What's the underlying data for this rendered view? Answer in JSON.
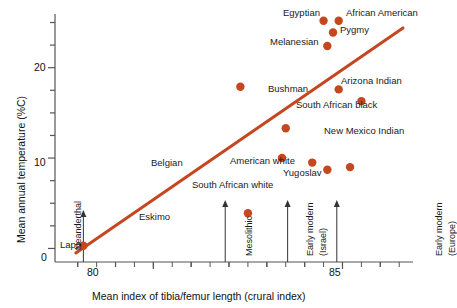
{
  "chart_data": {
    "type": "scatter",
    "title": "",
    "xlabel": "Mean index of tibia/femur length (crural index)",
    "ylabel": "Mean annual temperature (%C)",
    "xlim": [
      77.4,
      86.6
    ],
    "ylim": [
      -1.5,
      25.5
    ],
    "xticks": [
      78,
      79,
      80,
      81,
      82,
      83,
      84,
      85,
      86
    ],
    "xtick_labels": [
      "",
      "",
      "80",
      "",
      "",
      "",
      "",
      "85",
      ""
    ],
    "yticks": [
      0,
      2.5,
      5,
      7.5,
      10,
      12.5,
      15,
      17.5,
      20,
      22.5,
      25
    ],
    "ytick_labels": [
      "0",
      "",
      "",
      "",
      "10",
      "",
      "",
      "",
      "20",
      "",
      ""
    ],
    "grid": false,
    "legend": "none",
    "marker_color": "#c4471f",
    "line_color": "#c4471f",
    "axis_color": "#555555",
    "points": [
      {
        "label": "Lapp",
        "x": 78.15,
        "y": 0.3,
        "label_pos": "above-left"
      },
      {
        "label": "Eskimo",
        "x": 82.5,
        "y": 3.9,
        "label_pos": "left"
      },
      {
        "label": "Belgian",
        "x": 83.4,
        "y": 10.0,
        "label_pos": "left"
      },
      {
        "label": "American white",
        "x": 84.2,
        "y": 9.5,
        "label_pos": "right-above"
      },
      {
        "label": "South African white",
        "x": 84.6,
        "y": 8.7,
        "label_pos": "below-left"
      },
      {
        "label": "Yugoslav",
        "x": 85.2,
        "y": 9.0,
        "label_pos": "right"
      },
      {
        "label": "Bushman",
        "x": 82.3,
        "y": 17.9,
        "label_pos": "right"
      },
      {
        "label": "New Mexico Indian",
        "x": 83.5,
        "y": 13.3,
        "label_pos": "right"
      },
      {
        "label": "Arizona Indian",
        "x": 84.9,
        "y": 17.6,
        "label_pos": "above"
      },
      {
        "label": "South African black",
        "x": 85.5,
        "y": 16.3,
        "label_pos": "left"
      },
      {
        "label": "Melanesian",
        "x": 84.6,
        "y": 22.4,
        "label_pos": "left"
      },
      {
        "label": "Egyptian",
        "x": 84.5,
        "y": 25.2,
        "label_pos": "left"
      },
      {
        "label": "African American",
        "x": 84.9,
        "y": 25.2,
        "label_pos": "right"
      },
      {
        "label": "Pygmy",
        "x": 84.75,
        "y": 23.9,
        "label_pos": "right"
      }
    ],
    "trendline": {
      "x1": 77.95,
      "y1": -0.5,
      "x2": 86.6,
      "y2": 24.4
    },
    "annotations": [
      {
        "label": "Neanderthal",
        "x": 78.15,
        "type": "arrow-up"
      },
      {
        "label": "Mesolithic",
        "x": 81.9,
        "type": "arrow-up"
      },
      {
        "label": "Early modern\n(Israel)",
        "x": 83.55,
        "type": "arrow-up",
        "line1": "Early modern",
        "line2": "(Israel)"
      },
      {
        "label": "Early modern\n(Europe)",
        "x": 84.85,
        "type": "arrow-up",
        "line1": "Early modern",
        "line2": "(Europe)"
      }
    ]
  },
  "axis": {
    "y_title": "Mean annual temperature (%C)",
    "x_title": "Mean index of tibia/femur length (crural index)",
    "y_label_0": "0",
    "y_label_10": "10",
    "y_label_20": "20",
    "x_label_80": "80",
    "x_label_85": "85"
  },
  "point_labels": {
    "lapp": "Lapp",
    "eskimo": "Eskimo",
    "belgian": "Belgian",
    "american_white": "American white",
    "south_african_white": "South African white",
    "yugoslav": "Yugoslav",
    "bushman": "Bushman",
    "new_mexico_indian": "New Mexico Indian",
    "arizona_indian": "Arizona Indian",
    "south_african_black": "South African black",
    "melanesian": "Melanesian",
    "egyptian": "Egyptian",
    "african_american": "African American",
    "pygmy": "Pygmy"
  },
  "annotation_labels": {
    "neanderthal": "Neanderthal",
    "mesolithic": "Mesolithic",
    "early_modern_israel_1": "Early modern",
    "early_modern_israel_2": "(Israel)",
    "early_modern_europe_1": "Early modern",
    "early_modern_europe_2": "(Europe)"
  }
}
